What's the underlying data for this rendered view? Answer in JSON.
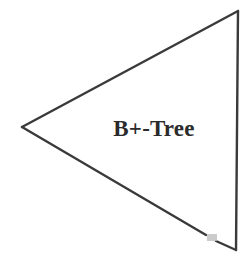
{
  "figure": {
    "name": "b-plus-tree-triangle-diagram",
    "background_color": "#ffffff",
    "width": 251,
    "height": 268,
    "stroke_color": "#3a3a3a",
    "stroke_width": 2.4,
    "shape": {
      "type": "triangle",
      "orientation": "left-pointing",
      "fill": "none",
      "vertices": [
        {
          "name": "top-right",
          "x": 238,
          "y": 11
        },
        {
          "name": "left-apex",
          "x": 22,
          "y": 127
        },
        {
          "name": "bottom-right",
          "x": 236,
          "y": 250
        }
      ]
    },
    "edges": [
      {
        "name": "top-edge",
        "from": "top-right",
        "to": "left-apex"
      },
      {
        "name": "bottom-edge",
        "from": "left-apex",
        "to": "bottom-right",
        "has_gap": true
      },
      {
        "name": "right-edge",
        "from": "bottom-right",
        "to": "top-right"
      }
    ],
    "artifact": {
      "name": "scan-gap-smudge",
      "color": "#b8b8b8",
      "x": 210,
      "y": 237,
      "width": 9,
      "height": 7
    },
    "label": {
      "text": "B+-Tree",
      "center_x": 154,
      "center_y": 128,
      "color": "#2b2b2b",
      "font_size_px": 23
    }
  }
}
